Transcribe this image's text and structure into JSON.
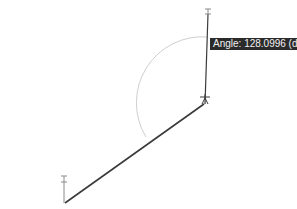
{
  "tooltip": {
    "label": "Angle:",
    "value": "128.0996",
    "unit": "(d)",
    "text": "Angle: 128.0996 (d)"
  },
  "drawing": {
    "line_color": "#3a3a3a",
    "arc_color": "#cfcfcf",
    "background": "#ffffff"
  }
}
